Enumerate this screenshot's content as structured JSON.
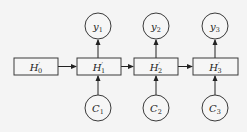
{
  "diagram": {
    "type": "recurrent-sequence-diagram",
    "hidden_states": [
      {
        "id": "H0",
        "base": "H",
        "prime": "′",
        "sub": "0",
        "x": 14,
        "y": 58,
        "w": 44,
        "h": 17
      },
      {
        "id": "H1",
        "base": "H",
        "prime": "′",
        "sub": "1",
        "x": 77,
        "y": 58,
        "w": 44,
        "h": 17
      },
      {
        "id": "H2",
        "base": "H",
        "prime": "′",
        "sub": "2",
        "x": 134,
        "y": 58,
        "w": 44,
        "h": 17
      },
      {
        "id": "H3",
        "base": "H",
        "prime": "′",
        "sub": "3",
        "x": 193,
        "y": 58,
        "w": 45,
        "h": 17
      }
    ],
    "outputs": [
      {
        "id": "y1",
        "base": "y",
        "sub": "1",
        "cx": 98,
        "cy": 26,
        "r": 13
      },
      {
        "id": "y2",
        "base": "y",
        "sub": "2",
        "cx": 156,
        "cy": 26,
        "r": 13
      },
      {
        "id": "y3",
        "base": "y",
        "sub": "3",
        "cx": 215,
        "cy": 26,
        "r": 13
      }
    ],
    "inputs": [
      {
        "id": "C1",
        "base": "C",
        "sub": "1",
        "cx": 98,
        "cy": 108,
        "r": 13
      },
      {
        "id": "C2",
        "base": "C",
        "sub": "2",
        "cx": 156,
        "cy": 108,
        "r": 13
      },
      {
        "id": "C3",
        "base": "C",
        "sub": "3",
        "cx": 215,
        "cy": 108,
        "r": 13
      }
    ],
    "edges": [
      {
        "from": "H0",
        "to": "H1"
      },
      {
        "from": "H1",
        "to": "H2"
      },
      {
        "from": "H2",
        "to": "H3"
      },
      {
        "from": "C1",
        "to": "H1"
      },
      {
        "from": "C2",
        "to": "H2"
      },
      {
        "from": "C3",
        "to": "H3"
      },
      {
        "from": "H1",
        "to": "y1"
      },
      {
        "from": "H2",
        "to": "y2"
      },
      {
        "from": "H3",
        "to": "y3"
      }
    ],
    "colors": {
      "background": "#f4f4f4",
      "stroke": "#3a3a3a",
      "text": "#222222"
    }
  }
}
